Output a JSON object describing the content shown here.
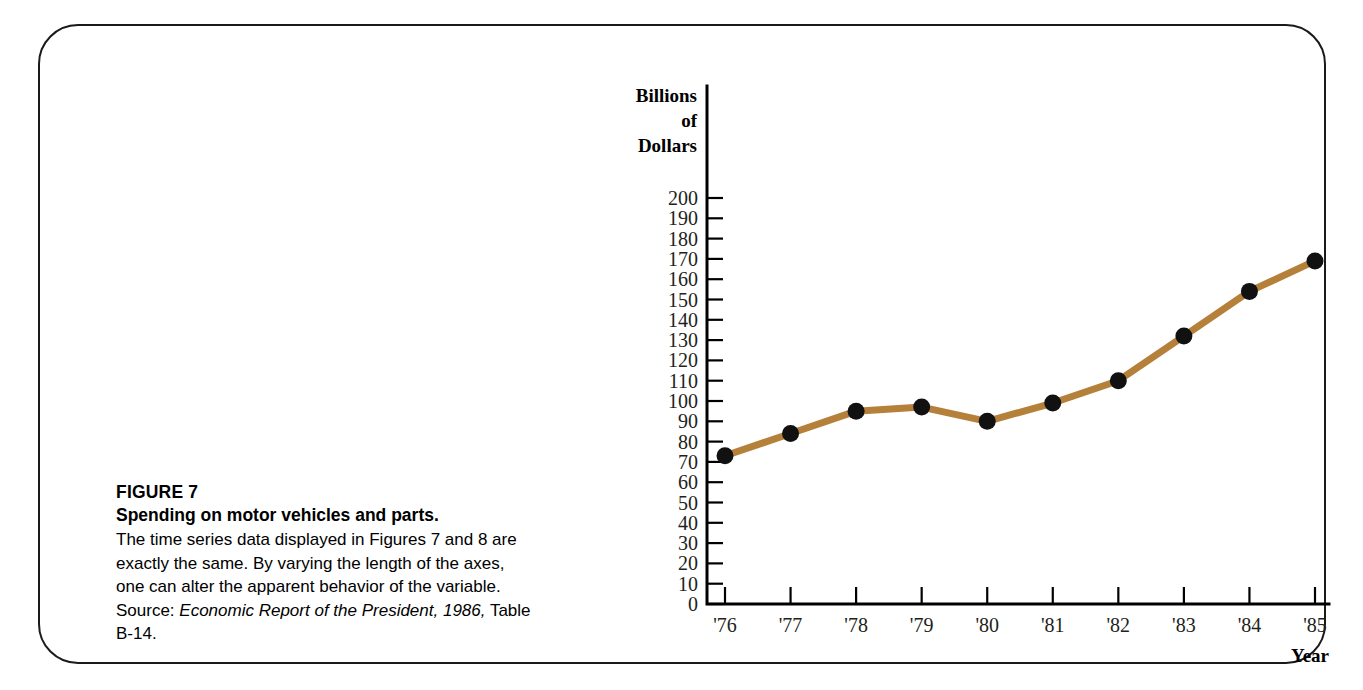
{
  "figure": {
    "number_label": "FIGURE 7",
    "title": "Spending on motor vehicles and parts.",
    "body_text_part1": "The time series data displayed in Figures 7 and 8 are exactly the same. By varying the length of the axes, one can alter the apparent behavior of the variable.  Source: ",
    "source_italic": "Economic Report of the President, 1986,",
    "body_text_part2": " Table B-14."
  },
  "chart_data": {
    "type": "line",
    "title": "",
    "xlabel": "Year",
    "ylabel": "Billions of Dollars",
    "ylabel_lines": [
      "Billions",
      "of",
      "Dollars"
    ],
    "categories": [
      "'76",
      "'77",
      "'78",
      "'79",
      "'80",
      "'81",
      "'82",
      "'83",
      "'84",
      "'85"
    ],
    "values": [
      73,
      84,
      95,
      97,
      90,
      99,
      110,
      132,
      154,
      169
    ],
    "series": [
      {
        "name": "Spending on motor vehicles and parts",
        "values": [
          73,
          84,
          95,
          97,
          90,
          99,
          110,
          132,
          154,
          169
        ]
      }
    ],
    "ylim": [
      0,
      200
    ],
    "y_tick_step": 10,
    "y_ticks": [
      0,
      10,
      20,
      30,
      40,
      50,
      60,
      70,
      80,
      90,
      100,
      110,
      120,
      130,
      140,
      150,
      160,
      170,
      180,
      190,
      200
    ],
    "y_tick_labels": [
      "0",
      "10",
      "20",
      "30",
      "40",
      "50",
      "60",
      "70",
      "80",
      "90",
      "100",
      "110",
      "120",
      "130",
      "140",
      "150",
      "160",
      "170",
      "180",
      "190",
      "200"
    ],
    "grid": false,
    "legend": "none",
    "line_color": "#b5803a",
    "marker_color": "#111111",
    "axis_color": "#000000"
  }
}
